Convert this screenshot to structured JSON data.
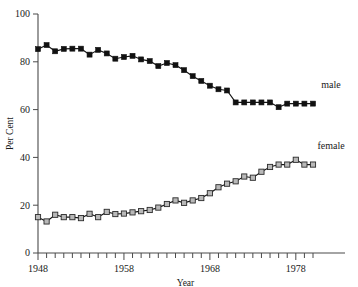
{
  "chart_data": {
    "type": "line",
    "title": "",
    "xlabel": "Year",
    "ylabel": "Per Cent",
    "xlim": [
      1948,
      1980
    ],
    "ylim": [
      0,
      100
    ],
    "grid": false,
    "legend_position": "right-inline",
    "yticks": [
      0,
      20,
      40,
      60,
      80,
      100
    ],
    "ytick_labels": [
      "0",
      "20",
      "40",
      "60",
      "80",
      "100"
    ],
    "xticks": [
      1948,
      1958,
      1968,
      1978
    ],
    "xtick_labels": [
      "1948",
      "1958",
      "1968",
      "1978"
    ],
    "x_minor_tick_step": 1,
    "x": [
      1948,
      1949,
      1950,
      1951,
      1952,
      1953,
      1954,
      1955,
      1956,
      1957,
      1958,
      1959,
      1960,
      1961,
      1962,
      1963,
      1964,
      1965,
      1966,
      1967,
      1968,
      1969,
      1970,
      1971,
      1972,
      1973,
      1974,
      1975,
      1976,
      1977,
      1978,
      1979,
      1980
    ],
    "series": [
      {
        "name": "male",
        "label": "male",
        "marker": "filled-square",
        "color": "#111111",
        "values": [
          85.3,
          87.0,
          84.4,
          85.4,
          85.5,
          85.5,
          83.0,
          85.0,
          83.5,
          81.3,
          82.0,
          82.5,
          81.0,
          80.3,
          78.2,
          79.5,
          78.6,
          76.5,
          74.0,
          72.0,
          70.0,
          68.5,
          68.0,
          63.0,
          63.0,
          63.0,
          63.0,
          63.0,
          61.0,
          62.5,
          62.5,
          62.5,
          62.5
        ]
      },
      {
        "name": "female",
        "label": "female",
        "marker": "open-square",
        "color": "#b9b9b9",
        "values": [
          15.0,
          13.2,
          16.0,
          15.0,
          15.0,
          14.6,
          16.4,
          15.0,
          17.2,
          16.3,
          16.5,
          17.0,
          17.5,
          18.0,
          19.0,
          20.5,
          22.0,
          21.0,
          22.0,
          23.0,
          25.0,
          27.5,
          29.0,
          30.0,
          32.0,
          31.5,
          34.0,
          36.0,
          37.0,
          37.0,
          39.0,
          37.0,
          37.0
        ]
      }
    ]
  },
  "labels": {
    "y_axis_title": "Per Cent",
    "x_axis_title": "Year",
    "male_series_label": "male",
    "female_series_label": "female"
  }
}
